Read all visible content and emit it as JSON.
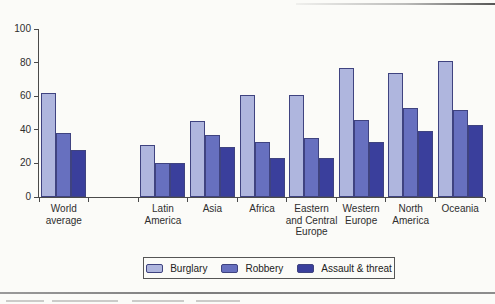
{
  "chart_data": {
    "type": "bar",
    "title": "",
    "xlabel": "",
    "ylabel": "",
    "ylim": [
      0,
      100
    ],
    "y_ticks": [
      0,
      20,
      40,
      60,
      80,
      100
    ],
    "grid": false,
    "legend_position": "bottom",
    "num_slots": 9,
    "series": [
      {
        "name": "Burglary",
        "color": "#afb6de"
      },
      {
        "name": "Robbery",
        "color": "#6770bf"
      },
      {
        "name": "Assault & threat",
        "color": "#3a3f9c"
      }
    ],
    "groups": [
      {
        "label": "World average",
        "label_lines": [
          "World",
          "average"
        ],
        "slot": 0,
        "values": [
          62,
          38,
          28
        ]
      },
      {
        "label": "Latin America",
        "label_lines": [
          "Latin",
          "America"
        ],
        "slot": 2,
        "values": [
          31,
          20,
          20
        ]
      },
      {
        "label": "Asia",
        "label_lines": [
          "Asia"
        ],
        "slot": 3,
        "values": [
          45,
          37,
          30
        ]
      },
      {
        "label": "Africa",
        "label_lines": [
          "Africa"
        ],
        "slot": 4,
        "values": [
          61,
          33,
          23
        ]
      },
      {
        "label": "Eastern and Central Europe",
        "label_lines": [
          "Eastern",
          "and Central",
          "Europe"
        ],
        "slot": 5,
        "values": [
          61,
          35,
          23
        ]
      },
      {
        "label": "Western Europe",
        "label_lines": [
          "Western",
          "Europe"
        ],
        "slot": 6,
        "values": [
          77,
          46,
          33
        ]
      },
      {
        "label": "North America",
        "label_lines": [
          "North",
          "America"
        ],
        "slot": 7,
        "values": [
          74,
          53,
          39
        ]
      },
      {
        "label": "Oceania",
        "label_lines": [
          "Oceania"
        ],
        "slot": 8,
        "values": [
          81,
          52,
          43
        ]
      }
    ]
  },
  "colors": {
    "background": "#fbfbf8",
    "axis": "#4a4a4a",
    "text": "#2e2e2e",
    "bar_border": "#3f4380",
    "legend_border": "#555555",
    "bottom_rule": "#8a8a8a"
  }
}
